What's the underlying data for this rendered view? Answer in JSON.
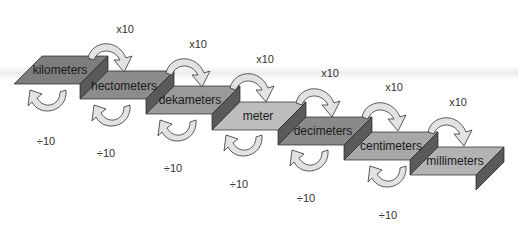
{
  "diagram": {
    "type": "metric-length-staircase",
    "steps": [
      {
        "label": "kilometers",
        "color": "#7d7d7d"
      },
      {
        "label": "hectometers",
        "color": "#8c8c8c"
      },
      {
        "label": "dekameters",
        "color": "#9a9a9a"
      },
      {
        "label": "meter",
        "color": "#bdbdbd"
      },
      {
        "label": "decimeters",
        "color": "#8a8a8a"
      },
      {
        "label": "centimeters",
        "color": "#a8a8a8"
      },
      {
        "label": "millimeters",
        "color": "#b3b3b3"
      }
    ],
    "multiply_labels": [
      "x10",
      "x10",
      "x10",
      "x10",
      "x10",
      "x10"
    ],
    "divide_labels": [
      "÷10",
      "÷10",
      "÷10",
      "÷10",
      "÷10",
      "÷10"
    ],
    "colors": {
      "arrow_fill": "#e2e2e2",
      "arrow_stroke": "#333333",
      "side_face": "#5a5a5a",
      "edge": "#222222"
    }
  }
}
